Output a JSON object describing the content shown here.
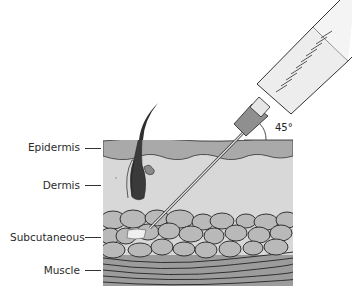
{
  "diagram": {
    "type": "subcutaneous injection illustration",
    "needle_angle": "45°",
    "layers": [
      {
        "label": "Epidermis",
        "color": "#a8a8a8"
      },
      {
        "label": "Dermis",
        "color": "#d6d6d6"
      },
      {
        "label": "Subcutaneous",
        "color": "#b8b8b8"
      },
      {
        "label": "Muscle",
        "color": "#9a9a9a"
      }
    ]
  }
}
